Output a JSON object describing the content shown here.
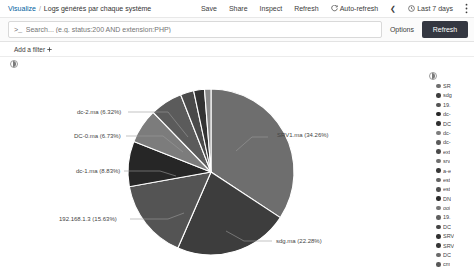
{
  "header": {
    "breadcrumb_root": "Visualize",
    "breadcrumb_sep": "/",
    "breadcrumb_title": "Logs générés par chaque système",
    "save_label": "Save",
    "share_label": "Share",
    "inspect_label": "Inspect",
    "refresh_label": "Refresh",
    "auto_refresh_label": "Auto-refresh",
    "auto_refresh_icon": "refresh-cycle-icon",
    "prev_chevron": "❮",
    "time_picker_label": "Last 7 days",
    "clock_icon": "clock-icon",
    "menu_icon": "vertical-dots-icon"
  },
  "query": {
    "prompt_icon": ">_",
    "placeholder": "Search... (e.g. status:200 AND extension:PHP)",
    "value": "",
    "options_label": "Options",
    "refresh_button_label": "Refresh",
    "refresh_button_color": "#343741"
  },
  "filters": {
    "add_filter_label": "Add a filter",
    "add_filter_icon": "plus-icon"
  },
  "panel": {
    "collapse_icon": "collapse-toggle-icon"
  },
  "legend": {
    "toggle_icon": "legend-toggle-icon",
    "items": [
      {
        "label": "SR",
        "color": "#6e6e6e"
      },
      {
        "label": "sdg",
        "color": "#3d3d3d"
      },
      {
        "label": "19.",
        "color": "#545454"
      },
      {
        "label": "dc-",
        "color": "#262626"
      },
      {
        "label": "DC",
        "color": "#2f2f2f"
      },
      {
        "label": "dc-",
        "color": "#7c7c7c"
      },
      {
        "label": "dc-",
        "color": "#5b5b5b"
      },
      {
        "label": "ext",
        "color": "#4a4a4a"
      },
      {
        "label": "srv",
        "color": "#707070"
      },
      {
        "label": "a-e",
        "color": "#383838"
      },
      {
        "label": "est",
        "color": "#636363"
      },
      {
        "label": "est",
        "color": "#4f4f4f"
      },
      {
        "label": "DN",
        "color": "#2b2b2b"
      },
      {
        "label": "ooi",
        "color": "#767676"
      },
      {
        "label": "19.",
        "color": "#5f5f5f"
      },
      {
        "label": "DC",
        "color": "#434343"
      },
      {
        "label": "SRV",
        "color": "#303030"
      },
      {
        "label": "SRV",
        "color": "#353535"
      },
      {
        "label": "DC",
        "color": "#6a6a6a"
      },
      {
        "label": "cm",
        "color": "#585858"
      }
    ]
  },
  "chart_data": {
    "type": "pie",
    "title": "Logs générés par chaque système",
    "legend_position": "right",
    "grid": false,
    "unit": "%",
    "categories": [
      "SRV1.ma",
      "sdg.ma",
      "192.168.1.3",
      "dc-1.ma",
      "DC-0.ma",
      "dc-2.ma",
      "other-1",
      "other-2",
      "other-3"
    ],
    "values": [
      34.26,
      22.28,
      15.63,
      8.83,
      6.73,
      6.32,
      2.6,
      2.1,
      1.25
    ],
    "colors": [
      "#6e6e6e",
      "#3d3d3d",
      "#545454",
      "#262626",
      "#7c7c7c",
      "#5b5b5b",
      "#4a4a4a",
      "#333333",
      "#8a8a8a"
    ],
    "labels": [
      {
        "text": "SRV1.ma (34.26%)",
        "x": 277,
        "y": 61
      },
      {
        "text": "sdg.ma (22.28%)",
        "x": 276,
        "y": 167
      },
      {
        "text": "192.168.1.3 (15.63%)",
        "x": 59,
        "y": 145
      },
      {
        "text": "dc-1.ma (8.83%)",
        "x": 76,
        "y": 97
      },
      {
        "text": "DC-0.ma (6.73%)",
        "x": 74,
        "y": 62
      },
      {
        "text": "dc-2.ma (6.32%)",
        "x": 77,
        "y": 38
      }
    ]
  }
}
